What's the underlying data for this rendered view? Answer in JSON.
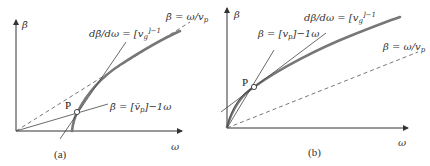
{
  "figure": {
    "panels": [
      {
        "id": "a",
        "caption": "(a)",
        "y_axis_label": "β̄",
        "x_axis_label": "ω",
        "point_label": "P",
        "annotations": {
          "phase_line": "β̄ = ω/v",
          "phase_line_sub": "p",
          "group_tangent": "dβ̄/dω = [v",
          "group_tangent_sub": "g",
          "group_tangent_sup": "]−1",
          "secant": "β̄ = [v̄",
          "secant_sub": "p",
          "secant_tail": "]−1ω"
        }
      },
      {
        "id": "b",
        "caption": "(b)",
        "y_axis_label": "β",
        "x_axis_label": "ω",
        "point_label": "P",
        "annotations": {
          "phase_line": "β = ω/v",
          "phase_line_sub": "p",
          "group_tangent": "dβ/dω = [v",
          "group_tangent_sub": "g",
          "group_tangent_sup": "]−1",
          "secant": "β = [v",
          "secant_sub": "p",
          "secant_tail": "]−1ω"
        }
      }
    ]
  }
}
